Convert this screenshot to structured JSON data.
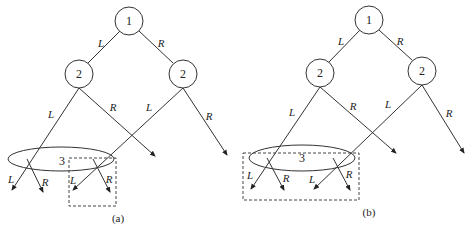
{
  "panels": {
    "a": {
      "caption": "(a)",
      "root_label": "1",
      "left_child_label": "2",
      "right_child_label": "2",
      "ellipse_label": "3",
      "edges": {
        "root_left": "L",
        "root_right": "R",
        "left_L": "L",
        "left_R": "R",
        "right_L": "L",
        "right_R": "R",
        "leaf1": "L",
        "leaf2": "R",
        "leaf3": "L",
        "leaf4": "R"
      }
    },
    "b": {
      "caption": "(b)",
      "root_label": "1",
      "left_child_label": "2",
      "right_child_label": "2",
      "ellipse_label": "3",
      "edges": {
        "root_left": "L",
        "root_right": "R",
        "left_L": "L",
        "left_R": "R",
        "right_L": "L",
        "right_R": "R",
        "leaf1": "L",
        "leaf2": "R",
        "leaf3": "L",
        "leaf4": "R"
      }
    }
  }
}
